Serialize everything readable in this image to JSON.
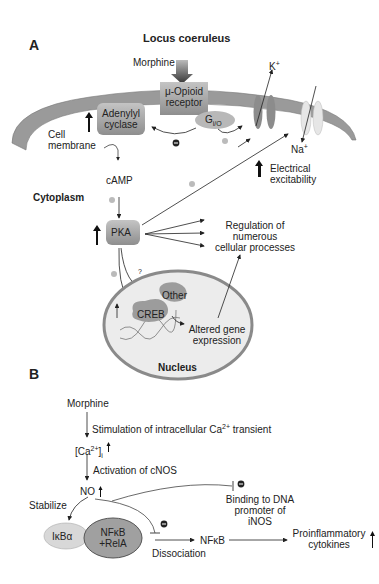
{
  "panel_a": {
    "label": "A",
    "title": "Locus coeruleus",
    "morphine": "Morphine",
    "receptor_line1": "μ-Opioid",
    "receptor_line2": "receptor",
    "adenylyl_line1": "Adenylyl",
    "adenylyl_line2": "cyclase",
    "gprotein": "G",
    "gprotein_sub": "i/O",
    "cell_line1": "Cell",
    "cell_line2": "membrane",
    "k_ion": "K",
    "k_sup": "+",
    "na_ion": "Na",
    "na_sup": "+",
    "camp": "cAMP",
    "cytoplasm": "Cytoplasm",
    "excit_line1": "Electrical",
    "excit_line2": "excitability",
    "pka": "PKA",
    "regulation_line1": "Regulation of",
    "regulation_line2": "numerous",
    "regulation_line3": "cellular processes",
    "question": "?",
    "other": "Other",
    "creb": "CREB",
    "altered_line1": "Altered gene",
    "altered_line2": "expression",
    "nucleus": "Nucleus",
    "plus": "+",
    "minus": "−"
  },
  "panel_b": {
    "label": "B",
    "morphine": "Morphine",
    "stimulation": "Stimulation of intracellular Ca",
    "stimulation_sup": "2+",
    "stimulation_end": " transient",
    "ca_text": "[Ca",
    "ca_sup": "2+",
    "ca_end": "]",
    "ca_sub": "i",
    "activation": "Activation of cNOS",
    "no": "NO",
    "stabilize": "Stabilize",
    "binding_line1": "Binding to DNA",
    "binding_line2": "promoter of",
    "binding_line3": "iNOS",
    "ikba": "IκBα",
    "nfkb_line1": "NFκB",
    "nfkb_line2": "+RelA",
    "nfkb": "NFκB",
    "dissociation": "Dissociation",
    "proinf_line1": "Proinflammatory",
    "proinf_line2": "cytokines",
    "minus": "−"
  },
  "colors": {
    "membrane": "#9a9a9a",
    "box": "#a8a8a8",
    "nucleus_fill": "#ececec",
    "nucleus_stroke": "#8a8a8a",
    "blob": "#9c9c9c",
    "ikba": "#d8d8d8",
    "nfkb": "#a0a0a0"
  }
}
